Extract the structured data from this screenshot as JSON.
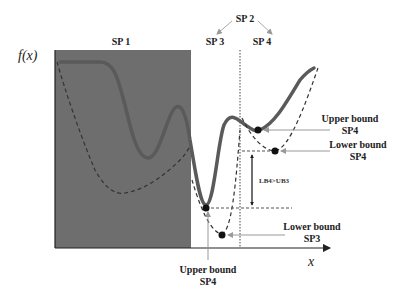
{
  "diagram": {
    "colors": {
      "shaded_region": "#6e6e6e",
      "upper_curve": "#5a5a5a",
      "lower_curve": "#333333",
      "arrow": "#999999",
      "text": "#222222"
    },
    "axes": {
      "y_label": "f(x)",
      "x_label": "x"
    },
    "regions": {
      "sp1": "SP 1",
      "sp2": "SP 2",
      "sp3": "SP 3",
      "sp4": "SP 4"
    },
    "annotations": {
      "upper_bound_sp4_right_line1": "Upper bound",
      "upper_bound_sp4_right_line2": "SP4",
      "lower_bound_sp4_line1": "Lower bound",
      "lower_bound_sp4_line2": "SP4",
      "lower_bound_sp3_line1": "Lower bound",
      "lower_bound_sp3_line2": "SP3",
      "upper_bound_bottom_line1": "Upper bound",
      "upper_bound_bottom_line2": "SP4",
      "gap": "LB4>UB3"
    }
  }
}
